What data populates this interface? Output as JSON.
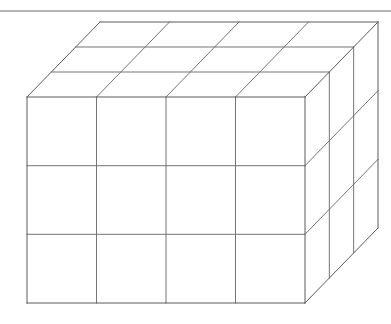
{
  "page": {
    "width": 391,
    "height": 324,
    "background": "#ffffff"
  },
  "rule": {
    "name": "horizontal-rule",
    "x1": 0,
    "y1": 11,
    "x2": 391,
    "y2": 11,
    "color": "#6b6b6b",
    "thickness": 1.1
  },
  "colors": {
    "stroke": "#5a5a5a",
    "grid_stroke": "#6e6e6e",
    "face": "#ffffff",
    "rule": "#6b6b6b"
  },
  "figure": {
    "type": "cuboid-grid",
    "projection": "oblique-cabinet",
    "front_face": {
      "left": 27,
      "top": 97,
      "right": 305,
      "bottom": 303,
      "columns": 4,
      "rows": 3,
      "column_x": [
        27,
        96.5,
        166,
        235.5,
        305
      ],
      "row_y": [
        97,
        165.7,
        234.3,
        303
      ]
    },
    "depth": {
      "dx": 73,
      "dy": -75,
      "divisions": 3,
      "fractions": [
        0,
        0.3333,
        0.6667,
        1
      ]
    },
    "cube_counts": {
      "width": 4,
      "height": 3,
      "depth": 3,
      "total": 36
    },
    "back_face": {
      "left": 100,
      "top": 22,
      "right": 378,
      "bottom": 228
    }
  }
}
